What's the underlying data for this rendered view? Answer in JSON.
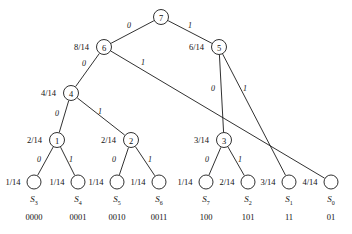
{
  "figure": {
    "type": "huffman-coding-tree",
    "denominator": "14",
    "line_color": "#1a1a1a",
    "node_fill": "#ffffff",
    "text_color": "#111111"
  },
  "internal_nodes": [
    {
      "id": "n7",
      "label": "7",
      "weight": "",
      "x": 161,
      "y": 17,
      "r": 7.5
    },
    {
      "id": "n6",
      "label": "6",
      "weight": "8/14",
      "x": 104,
      "y": 47,
      "r": 7.5
    },
    {
      "id": "n5",
      "label": "5",
      "weight": "6/14",
      "x": 219,
      "y": 47,
      "r": 7.5
    },
    {
      "id": "n4",
      "label": "4",
      "weight": "4/14",
      "x": 71,
      "y": 93,
      "r": 7.5
    },
    {
      "id": "n1",
      "label": "1",
      "weight": "2/14",
      "x": 57,
      "y": 140,
      "r": 7.5
    },
    {
      "id": "n2",
      "label": "2",
      "weight": "2/14",
      "x": 131,
      "y": 140,
      "r": 7.5
    },
    {
      "id": "n3",
      "label": "3",
      "weight": "3/14",
      "x": 224,
      "y": 140,
      "r": 7.5
    }
  ],
  "leaves": [
    {
      "id": "l0",
      "weight": "1/14",
      "symbol": "S",
      "sub": "3",
      "code": "0000",
      "x": 34,
      "y": 182,
      "r": 7
    },
    {
      "id": "l1",
      "weight": "1/14",
      "symbol": "S",
      "sub": "4",
      "code": "0001",
      "x": 78,
      "y": 182,
      "r": 7
    },
    {
      "id": "l2",
      "weight": "1/14",
      "symbol": "S",
      "sub": "5",
      "code": "0010",
      "x": 117,
      "y": 182,
      "r": 7
    },
    {
      "id": "l3",
      "weight": "1/14",
      "symbol": "S",
      "sub": "6",
      "code": "0011",
      "x": 159,
      "y": 182,
      "r": 7
    },
    {
      "id": "l4",
      "weight": "1/14",
      "symbol": "S",
      "sub": "7",
      "code": "100",
      "x": 206,
      "y": 182,
      "r": 7
    },
    {
      "id": "l5",
      "weight": "2/14",
      "symbol": "S",
      "sub": "2",
      "code": "101",
      "x": 248,
      "y": 182,
      "r": 7
    },
    {
      "id": "l6",
      "weight": "3/14",
      "symbol": "S",
      "sub": "1",
      "code": "11",
      "x": 289,
      "y": 182,
      "r": 7
    },
    {
      "id": "l7",
      "weight": "4/14",
      "symbol": "S",
      "sub": "0",
      "code": "01",
      "x": 331,
      "y": 182,
      "r": 7
    }
  ],
  "edges": [
    {
      "id": "e-7-6",
      "from": "n7",
      "to": "n6",
      "bit": "0",
      "lx": 129,
      "ly": 25
    },
    {
      "id": "e-7-5",
      "from": "n7",
      "to": "n5",
      "bit": "1",
      "lx": 190,
      "ly": 25
    },
    {
      "id": "e-6-4",
      "from": "n6",
      "to": "n4",
      "bit": "0",
      "lx": 84,
      "ly": 63
    },
    {
      "id": "e-6-l7",
      "from": "n6",
      "to": "l7",
      "bit": "1",
      "lx": 143,
      "ly": 62
    },
    {
      "id": "e-5-3",
      "from": "n5",
      "to": "n3",
      "bit": "0",
      "lx": 213,
      "ly": 88
    },
    {
      "id": "e-5-l6",
      "from": "n5",
      "to": "l6",
      "bit": "1",
      "lx": 245,
      "ly": 88
    },
    {
      "id": "e-4-1",
      "from": "n4",
      "to": "n1",
      "bit": "0",
      "lx": 57,
      "ly": 113
    },
    {
      "id": "e-4-2",
      "from": "n4",
      "to": "n2",
      "bit": "1",
      "lx": 100,
      "ly": 111
    },
    {
      "id": "e-1-l0",
      "from": "n1",
      "to": "l0",
      "bit": "0",
      "lx": 39,
      "ly": 159
    },
    {
      "id": "e-1-l1",
      "from": "n1",
      "to": "l1",
      "bit": "1",
      "lx": 71,
      "ly": 159
    },
    {
      "id": "e-2-l2",
      "from": "n2",
      "to": "l2",
      "bit": "0",
      "lx": 114,
      "ly": 159
    },
    {
      "id": "e-2-l3",
      "from": "n2",
      "to": "l3",
      "bit": "1",
      "lx": 150,
      "ly": 159
    },
    {
      "id": "e-3-l4",
      "from": "n3",
      "to": "l4",
      "bit": "0",
      "lx": 207,
      "ly": 159
    },
    {
      "id": "e-3-l5",
      "from": "n3",
      "to": "l5",
      "bit": "1",
      "lx": 240,
      "ly": 159
    }
  ],
  "chart_data": {
    "type": "diagram",
    "symbols": [
      "S3",
      "S4",
      "S5",
      "S6",
      "S7",
      "S2",
      "S1",
      "S0"
    ],
    "probabilities": [
      "1/14",
      "1/14",
      "1/14",
      "1/14",
      "1/14",
      "2/14",
      "3/14",
      "4/14"
    ],
    "codewords": [
      "0000",
      "0001",
      "0010",
      "0011",
      "100",
      "101",
      "11",
      "01"
    ]
  }
}
